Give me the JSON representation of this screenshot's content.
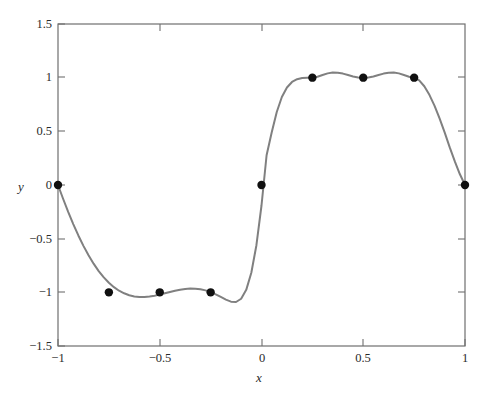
{
  "chart_data": {
    "type": "line",
    "title": "",
    "subtitle": "",
    "xlabel": "x",
    "ylabel": "y",
    "xlim": [
      -1,
      1
    ],
    "ylim": [
      -1.5,
      1.5
    ],
    "xticks": [
      -1,
      -0.5,
      0,
      0.5,
      1
    ],
    "xtick_labels": [
      "−1",
      "−0.5",
      "0",
      "0.5",
      "1"
    ],
    "yticks": [
      -1.5,
      -1,
      -0.5,
      0,
      0.5,
      1,
      1.5
    ],
    "ytick_labels": [
      "−1.5",
      "−1",
      "−0.5",
      "0",
      "0.5",
      "1",
      "1.5"
    ],
    "grid": false,
    "legend": "none",
    "series": [
      {
        "name": "interpolant",
        "style": "solid-line",
        "color": "#808080",
        "marker": "none"
      },
      {
        "name": "data points",
        "style": "markers",
        "color": "#101010",
        "marker": "filled-circle",
        "x": [
          -1,
          -0.75,
          -0.5,
          -0.25,
          0,
          0.25,
          0.5,
          0.75,
          1
        ],
        "y": [
          0,
          -1,
          -1,
          -1,
          0,
          1,
          1,
          1,
          0
        ]
      }
    ],
    "curve_points": {
      "x": [
        -1,
        -0.975,
        -0.95,
        -0.925,
        -0.9,
        -0.875,
        -0.85,
        -0.825,
        -0.8,
        -0.775,
        -0.75,
        -0.725,
        -0.7,
        -0.675,
        -0.65,
        -0.625,
        -0.6,
        -0.575,
        -0.55,
        -0.525,
        -0.5,
        -0.475,
        -0.45,
        -0.425,
        -0.4,
        -0.375,
        -0.35,
        -0.325,
        -0.3,
        -0.275,
        -0.25,
        -0.225,
        -0.2,
        -0.175,
        -0.15,
        -0.125,
        -0.1,
        -0.075,
        -0.05,
        -0.025,
        0,
        0.025,
        0.05,
        0.075,
        0.1,
        0.125,
        0.15,
        0.175,
        0.2,
        0.225,
        0.25,
        0.275,
        0.3,
        0.325,
        0.35,
        0.375,
        0.4,
        0.425,
        0.45,
        0.475,
        0.5,
        0.525,
        0.55,
        0.575,
        0.6,
        0.625,
        0.65,
        0.675,
        0.7,
        0.725,
        0.75,
        0.775,
        0.8,
        0.825,
        0.85,
        0.875,
        0.9,
        0.925,
        0.95,
        0.975,
        1
      ],
      "y": [
        0,
        -0.128,
        -0.25,
        -0.364,
        -0.47,
        -0.567,
        -0.655,
        -0.733,
        -0.802,
        -0.861,
        -0.911,
        -0.952,
        -0.985,
        -1.009,
        -1.027,
        -1.038,
        -1.043,
        -1.043,
        -1.039,
        -1.031,
        -1.021,
        -1.009,
        -0.997,
        -0.986,
        -0.976,
        -0.969,
        -0.965,
        -0.966,
        -0.971,
        -0.982,
        -0.998,
        -1.019,
        -1.043,
        -1.068,
        -1.087,
        -1.09,
        -1.06,
        -0.977,
        -0.818,
        -0.561,
        -0.191,
        0.277,
        0.49,
        0.68,
        0.82,
        0.908,
        0.96,
        0.986,
        0.996,
        0.999,
        1.0,
        1.009,
        1.025,
        1.04,
        1.048,
        1.046,
        1.038,
        1.025,
        1.011,
        1.001,
        0.998,
        1.001,
        1.011,
        1.025,
        1.038,
        1.046,
        1.048,
        1.04,
        1.025,
        1.009,
        1.0,
        0.975,
        0.92,
        0.84,
        0.74,
        0.62,
        0.49,
        0.35,
        0.22,
        0.1,
        0
      ]
    }
  },
  "axes": {
    "x_title": "x",
    "y_title": "y"
  }
}
